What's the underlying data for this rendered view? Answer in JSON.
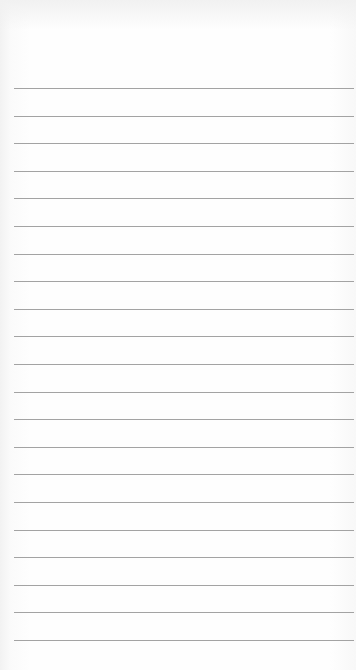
{
  "paper": {
    "type": "lined-notepad",
    "line_count": 21,
    "first_line_y": 88,
    "line_spacing": 27.6,
    "line_left": 14,
    "line_width": 340,
    "line_color": "#a3a3a3",
    "background_color": "#fefefe"
  }
}
